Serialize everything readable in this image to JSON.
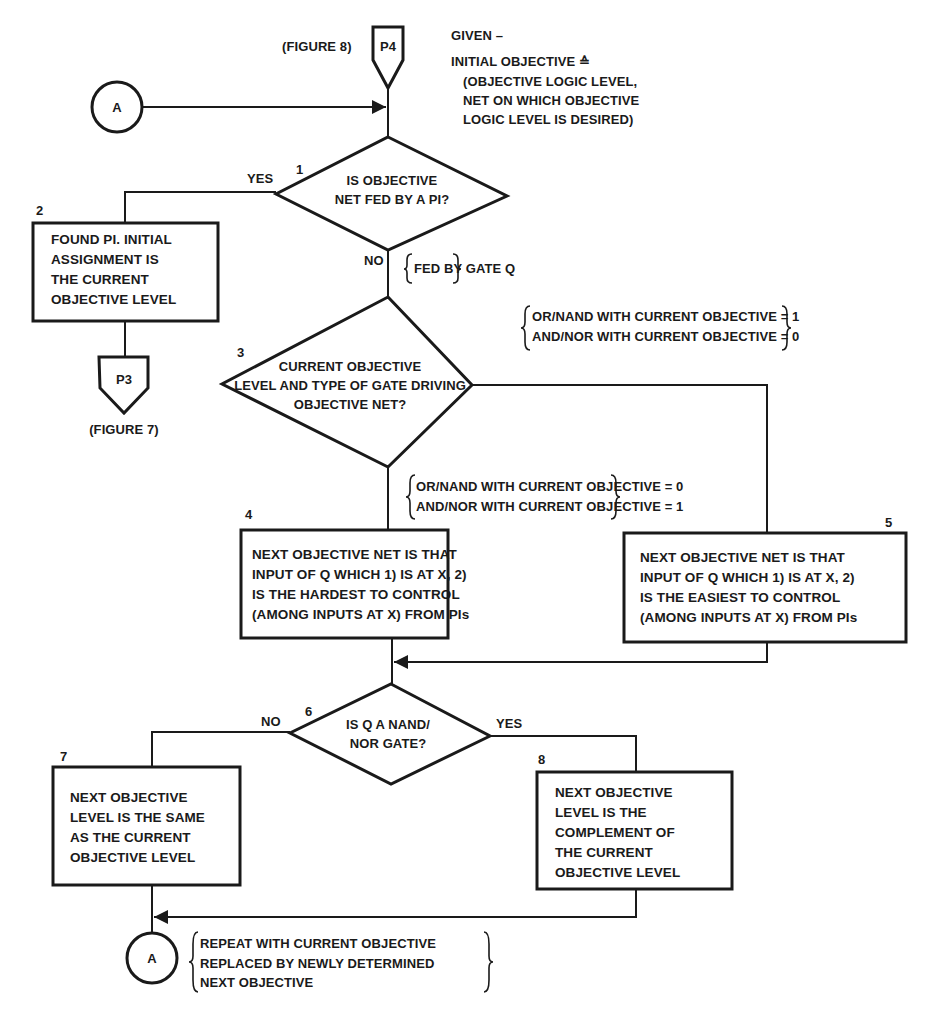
{
  "given": {
    "title": "GIVEN –",
    "lines": [
      "INITIAL OBJECTIVE ≙",
      "(OBJECTIVE LOGIC LEVEL,",
      "NET ON WHICH OBJECTIVE",
      "LOGIC LEVEL IS DESIRED)"
    ]
  },
  "connectors": {
    "p4": {
      "label": "P4",
      "ref": "(FIGURE 8)"
    },
    "p3": {
      "label": "P3",
      "ref": "(FIGURE 7)"
    },
    "a_top": {
      "label": "A"
    },
    "a_bottom": {
      "label": "A"
    }
  },
  "nodes": {
    "n1": {
      "number": "1",
      "type": "decision",
      "lines": [
        "IS OBJECTIVE",
        "NET FED BY A PI?"
      ]
    },
    "n2": {
      "number": "2",
      "type": "process",
      "lines": [
        "FOUND  PI. INITIAL",
        "ASSIGNMENT IS",
        "THE CURRENT",
        "OBJECTIVE LEVEL"
      ]
    },
    "n3": {
      "number": "3",
      "type": "decision",
      "lines": [
        "CURRENT OBJECTIVE",
        "LEVEL AND TYPE OF GATE DRIVING",
        "OBJECTIVE NET?"
      ]
    },
    "n4": {
      "number": "4",
      "type": "process",
      "lines": [
        "NEXT OBJECTIVE NET IS THAT",
        "INPUT OF Q WHICH 1) IS AT X, 2)",
        "IS THE HARDEST TO CONTROL",
        "(AMONG INPUTS AT X) FROM PIs"
      ]
    },
    "n5": {
      "number": "5",
      "type": "process",
      "lines": [
        "NEXT OBJECTIVE NET IS THAT",
        "INPUT OF Q WHICH 1) IS AT X, 2)",
        "IS THE EASIEST TO CONTROL",
        "(AMONG INPUTS AT X) FROM PIs"
      ]
    },
    "n6": {
      "number": "6",
      "type": "decision",
      "lines": [
        "IS Q A NAND/",
        "NOR GATE?"
      ]
    },
    "n7": {
      "number": "7",
      "type": "process",
      "lines": [
        "NEXT OBJECTIVE",
        "LEVEL IS THE SAME",
        "AS THE CURRENT",
        "OBJECTIVE LEVEL"
      ]
    },
    "n8": {
      "number": "8",
      "type": "process",
      "lines": [
        "NEXT OBJECTIVE",
        "LEVEL IS THE",
        "COMPLEMENT OF",
        "THE CURRENT",
        "OBJECTIVE LEVEL"
      ]
    }
  },
  "edge_labels": {
    "n1_yes": "YES",
    "n1_no": "NO",
    "n6_no": "NO",
    "n6_yes": "YES"
  },
  "annotations": {
    "fed_by_gate": "FED BY GATE Q",
    "to_easiest": [
      "OR/NAND WITH CURRENT OBJECTIVE = 1",
      "AND/NOR WITH CURRENT OBJECTIVE = 0"
    ],
    "to_hardest": [
      "OR/NAND WITH CURRENT OBJECTIVE = 0",
      "AND/NOR WITH CURRENT OBJECTIVE = 1"
    ],
    "repeat": [
      "REPEAT WITH CURRENT OBJECTIVE",
      "REPLACED BY NEWLY DETERMINED",
      "NEXT OBJECTIVE"
    ]
  },
  "colors": {
    "ink": "#1a1a1a",
    "paper": "#ffffff"
  }
}
